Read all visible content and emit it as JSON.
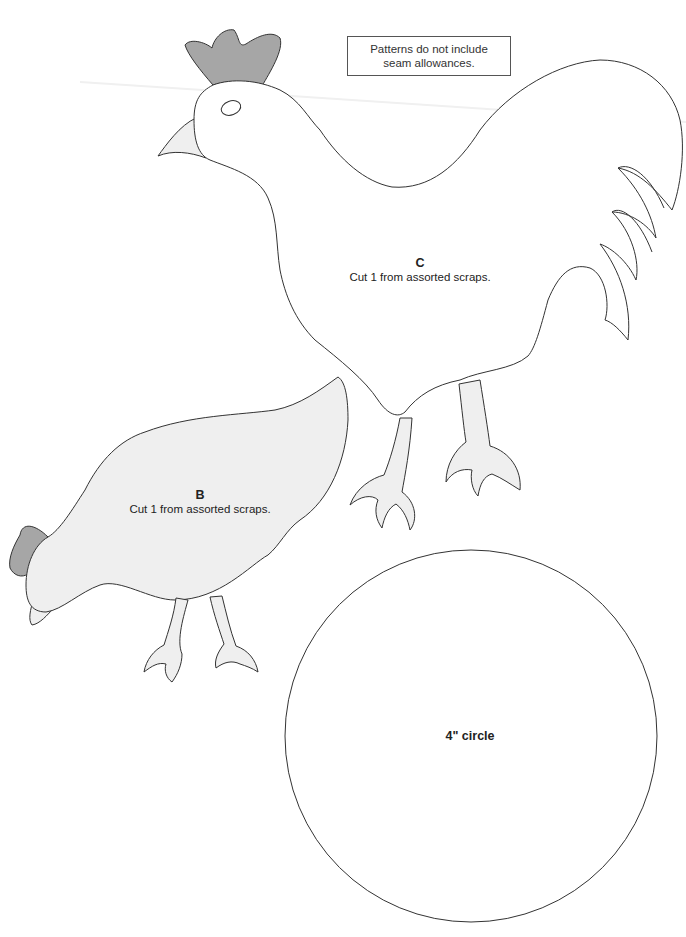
{
  "page": {
    "background": "#ffffff",
    "outline_color": "#333333",
    "comb_color": "#a6a6a6",
    "light_fill_color": "#efefef"
  },
  "note": {
    "line1": "Patterns do not include",
    "line2": "seam allowances."
  },
  "pieces": [
    {
      "id": "C",
      "letter": "C",
      "instruction": "Cut 1 from assorted scraps.",
      "shape": "rooster"
    },
    {
      "id": "B",
      "letter": "B",
      "instruction": "Cut 1 from assorted scraps.",
      "shape": "hen"
    }
  ],
  "circle": {
    "label": "4\" circle"
  }
}
